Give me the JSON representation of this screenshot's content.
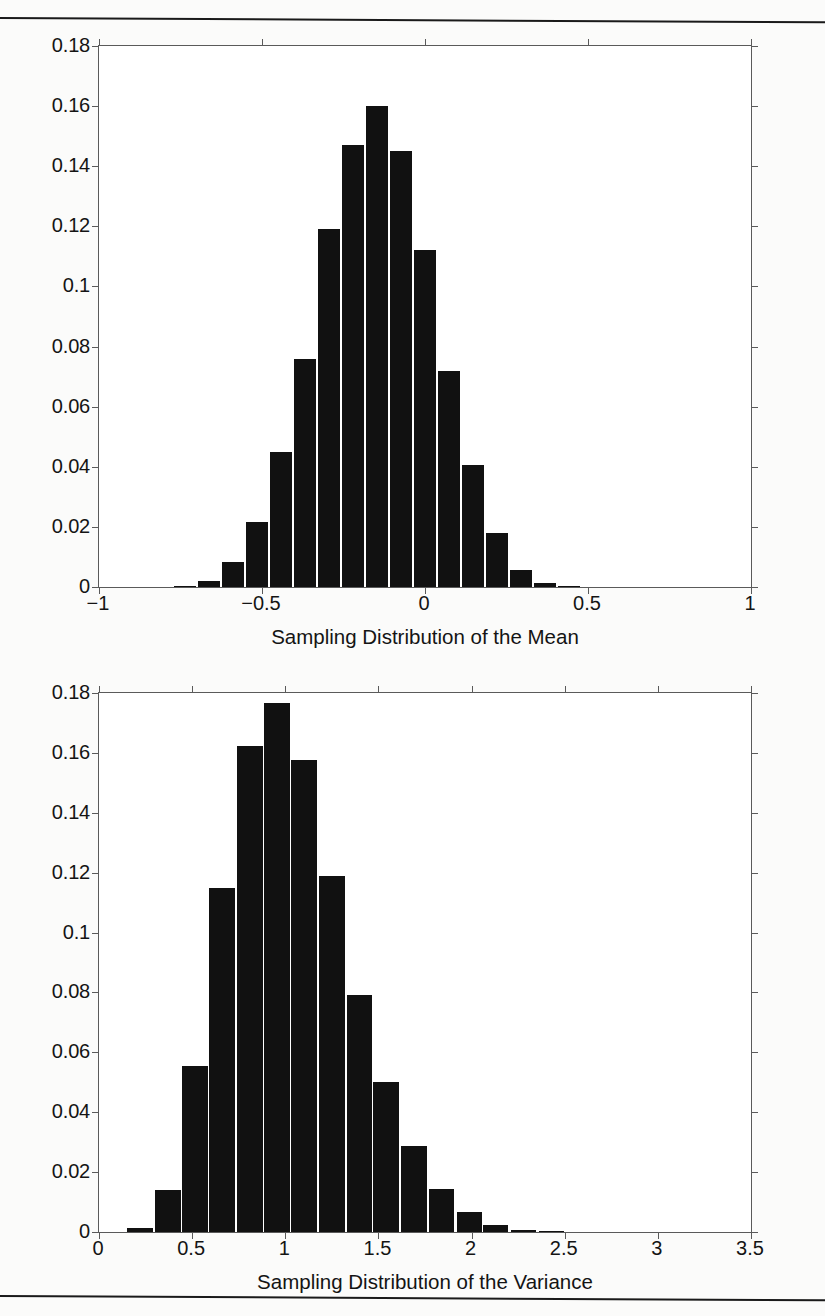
{
  "page": {
    "background_color": "#fbfbfa",
    "rule_color": "#1a1a1a",
    "axis_color": "#5a5a5a",
    "bar_color": "#111111"
  },
  "figures": [
    {
      "id": "mean",
      "caption": "Sampling Distribution of the Mean",
      "chart_data": {
        "type": "bar",
        "title": "",
        "xlabel": "Sampling Distribution of the Mean",
        "ylabel": "",
        "xlim": [
          -1,
          1
        ],
        "ylim": [
          0,
          0.18
        ],
        "grid": false,
        "legend": null,
        "xticks": [
          -1,
          -0.5,
          0,
          0.5,
          1
        ],
        "xtick_labels": [
          "-1",
          "-0.5",
          "0",
          "0.5",
          "1"
        ],
        "yticks": [
          0,
          0.02,
          0.04,
          0.06,
          0.08,
          0.1,
          0.12,
          0.14,
          0.16,
          0.18
        ],
        "ytick_labels": [
          "0",
          "0.02",
          "0.04",
          "0.06",
          "0.08",
          "0.1",
          "0.12",
          "0.14",
          "0.16",
          "0.18"
        ],
        "bin_width": 0.0735,
        "centers": [
          -0.735,
          -0.662,
          -0.588,
          -0.515,
          -0.441,
          -0.368,
          -0.294,
          -0.221,
          -0.147,
          -0.074,
          0.0,
          0.074,
          0.147,
          0.221,
          0.294,
          0.368,
          0.441,
          0.515,
          0.588,
          0.662,
          0.735
        ],
        "categories": [
          "-0.735",
          "-0.662",
          "-0.588",
          "-0.515",
          "-0.441",
          "-0.368",
          "-0.294",
          "-0.221",
          "-0.147",
          "-0.074",
          "0",
          "0.074",
          "0.147",
          "0.221",
          "0.294",
          "0.368",
          "0.441",
          "0.515",
          "0.588",
          "0.662",
          "0.735"
        ],
        "values": [
          0.0005,
          0.002,
          0.0082,
          0.0215,
          0.045,
          0.076,
          0.119,
          0.147,
          0.16,
          0.145,
          0.112,
          0.072,
          0.0405,
          0.018,
          0.0058,
          0.0012,
          0.0005,
          0,
          0,
          0,
          0
        ]
      }
    },
    {
      "id": "variance",
      "caption": "Sampling Distribution of the Variance",
      "chart_data": {
        "type": "bar",
        "title": "",
        "xlabel": "Sampling Distribution of the Variance",
        "ylabel": "",
        "xlim": [
          0,
          3.5
        ],
        "ylim": [
          0,
          0.18
        ],
        "grid": false,
        "legend": null,
        "xticks": [
          0,
          0.5,
          1,
          1.5,
          2,
          2.5,
          3,
          3.5
        ],
        "xtick_labels": [
          "0",
          "0.5",
          "1",
          "1.5",
          "2",
          "2.5",
          "3",
          "3.5"
        ],
        "yticks": [
          0,
          0.02,
          0.04,
          0.06,
          0.08,
          0.1,
          0.12,
          0.14,
          0.16,
          0.18
        ],
        "ytick_labels": [
          "0",
          "0.02",
          "0.04",
          "0.06",
          "0.08",
          "0.1",
          "0.12",
          "0.14",
          "0.16",
          "0.18"
        ],
        "bin_width": 0.147,
        "centers": [
          0.22,
          0.37,
          0.515,
          0.66,
          0.81,
          0.955,
          1.1,
          1.25,
          1.4,
          1.54,
          1.69,
          1.84,
          1.99,
          2.13,
          2.28,
          2.43
        ],
        "categories": [
          "0.22",
          "0.37",
          "0.515",
          "0.66",
          "0.81",
          "0.955",
          "1.10",
          "1.25",
          "1.40",
          "1.54",
          "1.69",
          "1.84",
          "1.99",
          "2.13",
          "2.28",
          "2.43"
        ],
        "values": [
          0.0012,
          0.014,
          0.0553,
          0.115,
          0.1622,
          0.1765,
          0.1575,
          0.119,
          0.0792,
          0.05,
          0.0288,
          0.0145,
          0.0067,
          0.0023,
          0.0008,
          0.0004
        ]
      }
    }
  ]
}
